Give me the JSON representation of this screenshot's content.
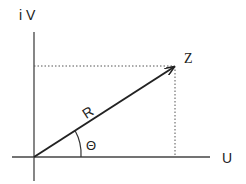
{
  "diagram": {
    "axis_y_label": "i V",
    "axis_x_label": "U",
    "point_label": "Z",
    "vector_label": "R",
    "angle_label": "Θ",
    "colors": {
      "line": "#222222",
      "background": "#ffffff"
    }
  }
}
